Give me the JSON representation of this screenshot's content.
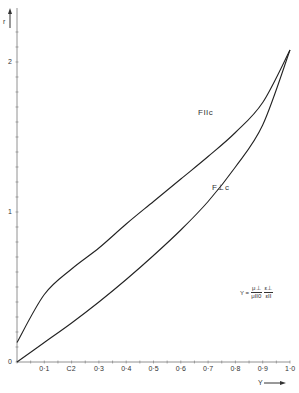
{
  "chart_data": {
    "type": "line",
    "title": "",
    "xlabel": "Y",
    "ylabel": "r",
    "xlim": [
      0,
      1.0
    ],
    "ylim": [
      0,
      2.2
    ],
    "grid": false,
    "x_ticks": [
      "0·1",
      "C2",
      "0·3",
      "0·4",
      "0·5",
      "0·6",
      "0·7",
      "0·8",
      "0·9",
      "1·0"
    ],
    "y_ticks": [
      "0",
      "1",
      "2"
    ],
    "x": [
      0,
      0.1,
      0.2,
      0.3,
      0.4,
      0.5,
      0.6,
      0.7,
      0.8,
      0.9,
      1.0
    ],
    "series": [
      {
        "name": "FIIc",
        "values": [
          0.13,
          0.45,
          0.62,
          0.76,
          0.92,
          1.07,
          1.22,
          1.37,
          1.53,
          1.73,
          2.08
        ]
      },
      {
        "name": "F⊥c",
        "values": [
          0.0,
          0.13,
          0.26,
          0.4,
          0.55,
          0.71,
          0.88,
          1.07,
          1.3,
          1.58,
          2.08
        ]
      }
    ],
    "annotations": {
      "formula_lhs": "Y =",
      "frac1_num": "μ⊥",
      "frac1_den": "μII0",
      "frac2_num": "ε⊥",
      "frac2_den": "εII"
    },
    "legend": "inline labels on curves"
  }
}
